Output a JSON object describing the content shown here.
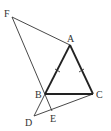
{
  "diagram": {
    "points": {
      "A": {
        "label": "A"
      },
      "B": {
        "label": "B"
      },
      "C": {
        "label": "C"
      },
      "D": {
        "label": "D"
      },
      "E": {
        "label": "E"
      },
      "F": {
        "label": "F"
      }
    },
    "segments": [
      {
        "from": "F",
        "to": "A",
        "style": "thin"
      },
      {
        "from": "F",
        "to": "E",
        "style": "thin",
        "passes_through": "B"
      },
      {
        "from": "B",
        "to": "D",
        "style": "thin"
      },
      {
        "from": "D",
        "to": "C",
        "style": "thin",
        "passes_through": "E"
      },
      {
        "from": "A",
        "to": "B",
        "style": "thick",
        "tick_marks": 1
      },
      {
        "from": "A",
        "to": "C",
        "style": "thick",
        "tick_marks": 1
      },
      {
        "from": "B",
        "to": "C",
        "style": "thick"
      }
    ],
    "equal_sides": [
      "AB",
      "AC"
    ]
  }
}
